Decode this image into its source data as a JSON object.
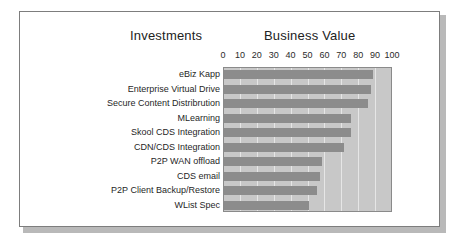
{
  "figure": {
    "headings": {
      "left": "Investments",
      "right": "Business Value"
    }
  },
  "chart_data": {
    "type": "bar",
    "orientation": "horizontal",
    "title": "Business Value",
    "xlabel": "Business Value",
    "ylabel": "Investments",
    "xlim": [
      0,
      100
    ],
    "ticks": [
      0,
      10,
      20,
      30,
      40,
      50,
      60,
      70,
      80,
      90,
      100
    ],
    "tick_labels": [
      "0",
      "10",
      "20",
      "30",
      "40",
      "50",
      "60",
      "70",
      "80",
      "90",
      "100"
    ],
    "grid": true,
    "legend": "none",
    "plot_background": "#c8c8c8",
    "bar_color": "#8c8c8c",
    "categories": [
      "eBiz Kapp",
      "Enterprise Virtual Drive",
      "Secure Content Distribrution",
      "MLearning",
      "Skool CDS Integration",
      "CDN/CDS Integration",
      "P2P WAN offload",
      "CDS email",
      "P2P Client Backup/Restore",
      "WList Spec"
    ],
    "values": [
      88,
      87,
      85,
      75,
      75,
      71,
      58,
      57,
      55,
      50
    ]
  }
}
